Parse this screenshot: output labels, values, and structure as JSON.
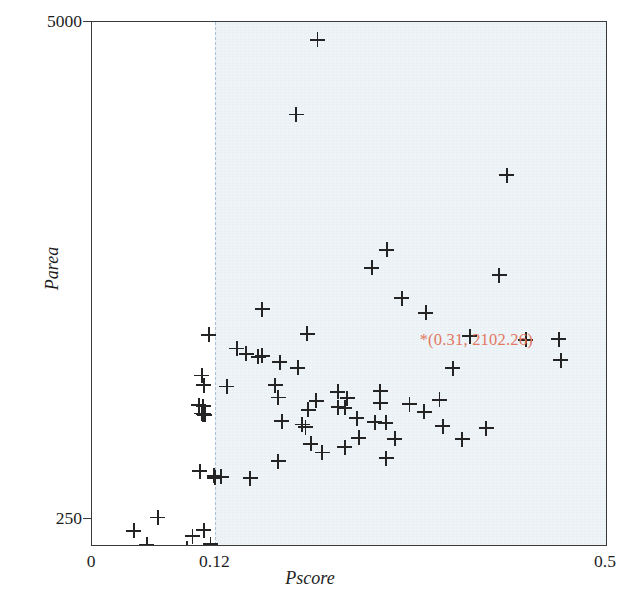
{
  "chart_data": {
    "type": "scatter",
    "title": "",
    "xlabel": "Pscore",
    "ylabel": "Parea",
    "xlim": [
      0,
      0.5
    ],
    "ylim": [
      250,
      5000
    ],
    "grid": false,
    "legend": null,
    "x_ticks": [
      {
        "value": 0,
        "label": "0"
      },
      {
        "value": 0.12,
        "label": "0.12"
      },
      {
        "value": 0.5,
        "label": "0.5"
      }
    ],
    "y_ticks": [
      {
        "value": 250,
        "label": "250"
      },
      {
        "value": 5000,
        "label": "5000"
      }
    ],
    "reference_lines": [
      {
        "orientation": "vertical",
        "value": 0.12,
        "style": "dashed",
        "color": "#a9c2d8"
      },
      {
        "orientation": "horizontal",
        "value": 250,
        "style": "dashed",
        "color": "#7b8aa6"
      }
    ],
    "shaded_region": {
      "from_x": 0.12,
      "to_x": 0.5,
      "color": "#eaf1f5",
      "label": "selected region"
    },
    "annotations": [
      {
        "text": "*(0.31, 2102.26)",
        "x": 0.31,
        "y": 2102.26,
        "color": "#e3775f"
      }
    ],
    "marker": {
      "shape": "plus",
      "color": "#242424",
      "size": 15
    },
    "points": [
      {
        "x": 0.2193,
        "y": 4840
      },
      {
        "x": 0.1988,
        "y": 4160
      },
      {
        "x": 0.4035,
        "y": 3610
      },
      {
        "x": 0.2866,
        "y": 2930
      },
      {
        "x": 0.2721,
        "y": 2770
      },
      {
        "x": 0.3962,
        "y": 2700
      },
      {
        "x": 0.3014,
        "y": 2490
      },
      {
        "x": 0.1657,
        "y": 2390
      },
      {
        "x": 0.3247,
        "y": 2360
      },
      {
        "x": 0.2094,
        "y": 2170
      },
      {
        "x": 0.1138,
        "y": 2160
      },
      {
        "x": 0.3675,
        "y": 2145
      },
      {
        "x": 0.454,
        "y": 2120
      },
      {
        "x": 0.4219,
        "y": 2112
      },
      {
        "x": 0.1409,
        "y": 2035
      },
      {
        "x": 0.1501,
        "y": 1985
      },
      {
        "x": 0.1618,
        "y": 1960
      },
      {
        "x": 0.1657,
        "y": 1970
      },
      {
        "x": 0.456,
        "y": 1930
      },
      {
        "x": 0.1826,
        "y": 1910
      },
      {
        "x": 0.2002,
        "y": 1860
      },
      {
        "x": 0.3508,
        "y": 1855
      },
      {
        "x": 0.1069,
        "y": 1790
      },
      {
        "x": 0.1085,
        "y": 1700
      },
      {
        "x": 0.1312,
        "y": 1690
      },
      {
        "x": 0.1782,
        "y": 1700
      },
      {
        "x": 0.1811,
        "y": 1590
      },
      {
        "x": 0.2389,
        "y": 1640
      },
      {
        "x": 0.2804,
        "y": 1645
      },
      {
        "x": 0.2482,
        "y": 1585
      },
      {
        "x": 0.2182,
        "y": 1560
      },
      {
        "x": 0.2804,
        "y": 1540
      },
      {
        "x": 0.3088,
        "y": 1530
      },
      {
        "x": 0.338,
        "y": 1570
      },
      {
        "x": 0.1037,
        "y": 1520
      },
      {
        "x": 0.108,
        "y": 1510
      },
      {
        "x": 0.2394,
        "y": 1500
      },
      {
        "x": 0.2459,
        "y": 1495
      },
      {
        "x": 0.2104,
        "y": 1480
      },
      {
        "x": 0.3232,
        "y": 1460
      },
      {
        "x": 0.1066,
        "y": 1445
      },
      {
        "x": 0.108,
        "y": 1438
      },
      {
        "x": 0.1095,
        "y": 1432
      },
      {
        "x": 0.2574,
        "y": 1400
      },
      {
        "x": 0.1846,
        "y": 1375
      },
      {
        "x": 0.275,
        "y": 1365
      },
      {
        "x": 0.2857,
        "y": 1360
      },
      {
        "x": 0.2043,
        "y": 1345
      },
      {
        "x": 0.341,
        "y": 1330
      },
      {
        "x": 0.2077,
        "y": 1320
      },
      {
        "x": 0.3836,
        "y": 1310
      },
      {
        "x": 0.2594,
        "y": 1225
      },
      {
        "x": 0.2945,
        "y": 1215
      },
      {
        "x": 0.36,
        "y": 1210
      },
      {
        "x": 0.2126,
        "y": 1170
      },
      {
        "x": 0.2458,
        "y": 1140
      },
      {
        "x": 0.2238,
        "y": 1090
      },
      {
        "x": 0.2862,
        "y": 1040
      },
      {
        "x": 0.1812,
        "y": 1010
      },
      {
        "x": 0.105,
        "y": 920
      },
      {
        "x": 0.1187,
        "y": 880
      },
      {
        "x": 0.1193,
        "y": 862
      },
      {
        "x": 0.1255,
        "y": 870
      },
      {
        "x": 0.154,
        "y": 855
      },
      {
        "x": 0.1085,
        "y": 385
      },
      {
        "x": 0.0977,
        "y": 330
      },
      {
        "x": 0.064,
        "y": 500
      },
      {
        "x": 0.0406,
        "y": 380
      },
      {
        "x": 0.0534,
        "y": 255
      },
      {
        "x": 0.1152,
        "y": 258
      },
      {
        "x": 0.0927,
        "y": 215
      },
      {
        "x": 0.0262,
        "y": 170
      }
    ]
  }
}
